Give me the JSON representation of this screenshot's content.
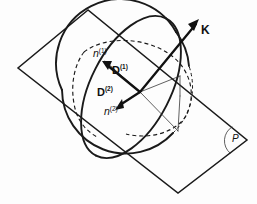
{
  "figure": {
    "background_color": "#fdfdfd",
    "ink_color": "#1a1a1a",
    "labels": {
      "wave_vector": {
        "name": "K",
        "text": "K",
        "style": "bold"
      },
      "displacement_1": {
        "name": "D(1)",
        "base": "D",
        "superscript": "(1)",
        "style": "bold"
      },
      "displacement_2": {
        "name": "D(2)",
        "base": "D",
        "superscript": "(2)",
        "style": "bold"
      },
      "index_1": {
        "name": "n(1)",
        "base": "n",
        "superscript": "(1)",
        "style": "italic"
      },
      "index_2": {
        "name": "n(2)",
        "base": "n",
        "superscript": "(2)",
        "style": "italic"
      },
      "plane": {
        "name": "P",
        "text": "P",
        "style": "italic"
      }
    },
    "shapes": {
      "plane": {
        "name": "wave-normal-plane",
        "type": "parallelogram",
        "corners": [
          [
            88,
            10
          ],
          [
            18,
            68
          ],
          [
            178,
            193
          ],
          [
            247,
            140
          ]
        ]
      },
      "sphere": {
        "name": "reference-sphere",
        "type": "circle",
        "center": [
          126,
          90
        ],
        "radius": 64
      },
      "indicatrix_ellipse": {
        "name": "section-ellipse",
        "type": "ellipse",
        "center": [
          131,
          87
        ],
        "rx": 40,
        "ry": 77,
        "rotation_deg": 27
      },
      "hidden_ellipse": {
        "name": "hidden-section-ellipse",
        "type": "ellipse-dashed",
        "center": [
          131,
          87
        ],
        "rx": 40,
        "ry": 77,
        "rotation_deg": 27
      },
      "angle_marker": {
        "name": "plane-angle-arc",
        "type": "arc",
        "vertex": [
          247,
          140
        ]
      }
    },
    "vectors": {
      "K": {
        "from": [
          140,
          92
        ],
        "to": [
          199,
          20
        ]
      },
      "D1": {
        "from": [
          140,
          92
        ],
        "to": [
          103,
          62
        ]
      },
      "D2": {
        "from": [
          140,
          92
        ],
        "to": [
          117,
          109
        ]
      }
    }
  }
}
